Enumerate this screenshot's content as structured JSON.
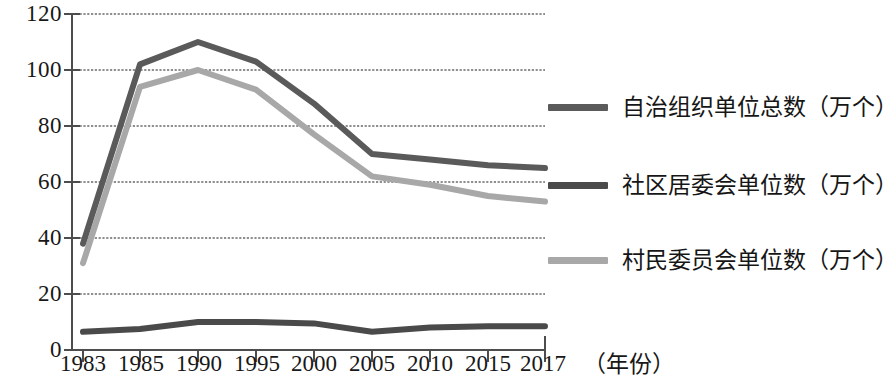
{
  "chart_data": {
    "type": "line",
    "title": "",
    "subtitle": "",
    "xlabel": "（年份）",
    "ylabel": "",
    "x": [
      "1983",
      "1985",
      "1990",
      "1995",
      "2000",
      "2005",
      "2010",
      "2015",
      "2017"
    ],
    "categories": [
      "1983",
      "1985",
      "1990",
      "1995",
      "2000",
      "2005",
      "2010",
      "2015",
      "2017"
    ],
    "xlim": [
      0,
      8
    ],
    "ylim": [
      0,
      120
    ],
    "yticks": [
      0,
      20,
      40,
      60,
      80,
      100,
      120
    ],
    "ytick_labels": [
      "0",
      "20",
      "40",
      "60",
      "80",
      "100",
      "120"
    ],
    "grid": true,
    "grid_axis": "y",
    "legend_position": "right",
    "series": [
      {
        "name": "自治组织单位总数（万个）",
        "color": "#5a5a5a",
        "width": 6,
        "values": [
          38,
          102,
          110,
          103,
          88,
          70,
          68,
          66,
          65
        ]
      },
      {
        "name": "社区居委会单位数（万个）",
        "color": "#4a4a4a",
        "width": 6,
        "values": [
          6.5,
          7.5,
          10,
          10,
          9.5,
          6.5,
          8,
          8.5,
          8.5
        ]
      },
      {
        "name": "村民委员会单位数（万个）",
        "color": "#a8a8a8",
        "width": 6,
        "values": [
          31,
          94,
          100,
          93,
          77,
          62,
          59,
          55,
          53
        ]
      }
    ]
  },
  "axes": {
    "y_ticks": [
      "120",
      "100",
      "80",
      "60",
      "40",
      "20",
      "0"
    ],
    "x_ticks": [
      "1983",
      "1985",
      "1990",
      "1995",
      "2000",
      "2005",
      "2010",
      "2015",
      "2017"
    ],
    "x_unit": "（年份）"
  },
  "legend": {
    "items": [
      {
        "label": "自治组织单位总数（万个）",
        "color": "#5a5a5a",
        "swatch": "line-swatch-dark"
      },
      {
        "label": "社区居委会单位数（万个）",
        "color": "#4a4a4a",
        "swatch": "line-swatch-darker"
      },
      {
        "label": "村民委员会单位数（万个）",
        "color": "#a8a8a8",
        "swatch": "line-swatch-light"
      }
    ]
  },
  "colors": {
    "axis": "#4d4d4d",
    "grid": "#6b6b6b",
    "background": "#ffffff",
    "text": "#181818"
  }
}
